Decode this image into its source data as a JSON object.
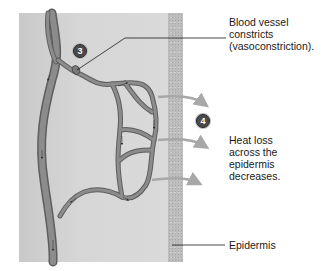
{
  "diagram": {
    "labels": {
      "vasoconstriction": [
        "Blood vessel",
        "constricts",
        "(vasoconstriction)."
      ],
      "heat_loss": [
        "Heat loss",
        "across the",
        "epidermis",
        "decreases."
      ],
      "epidermis": "Epidermis"
    },
    "badges": [
      "3",
      "4"
    ],
    "colors": {
      "background": "#ffffff",
      "tissue": "#d4d4d4",
      "epidermis": "#bdbdbd",
      "vessel": "#8a8a8a",
      "vessel_outline": "#5e5e5e",
      "heat_arrow": "#a8a8a8",
      "text": "#1a1a1a"
    }
  }
}
